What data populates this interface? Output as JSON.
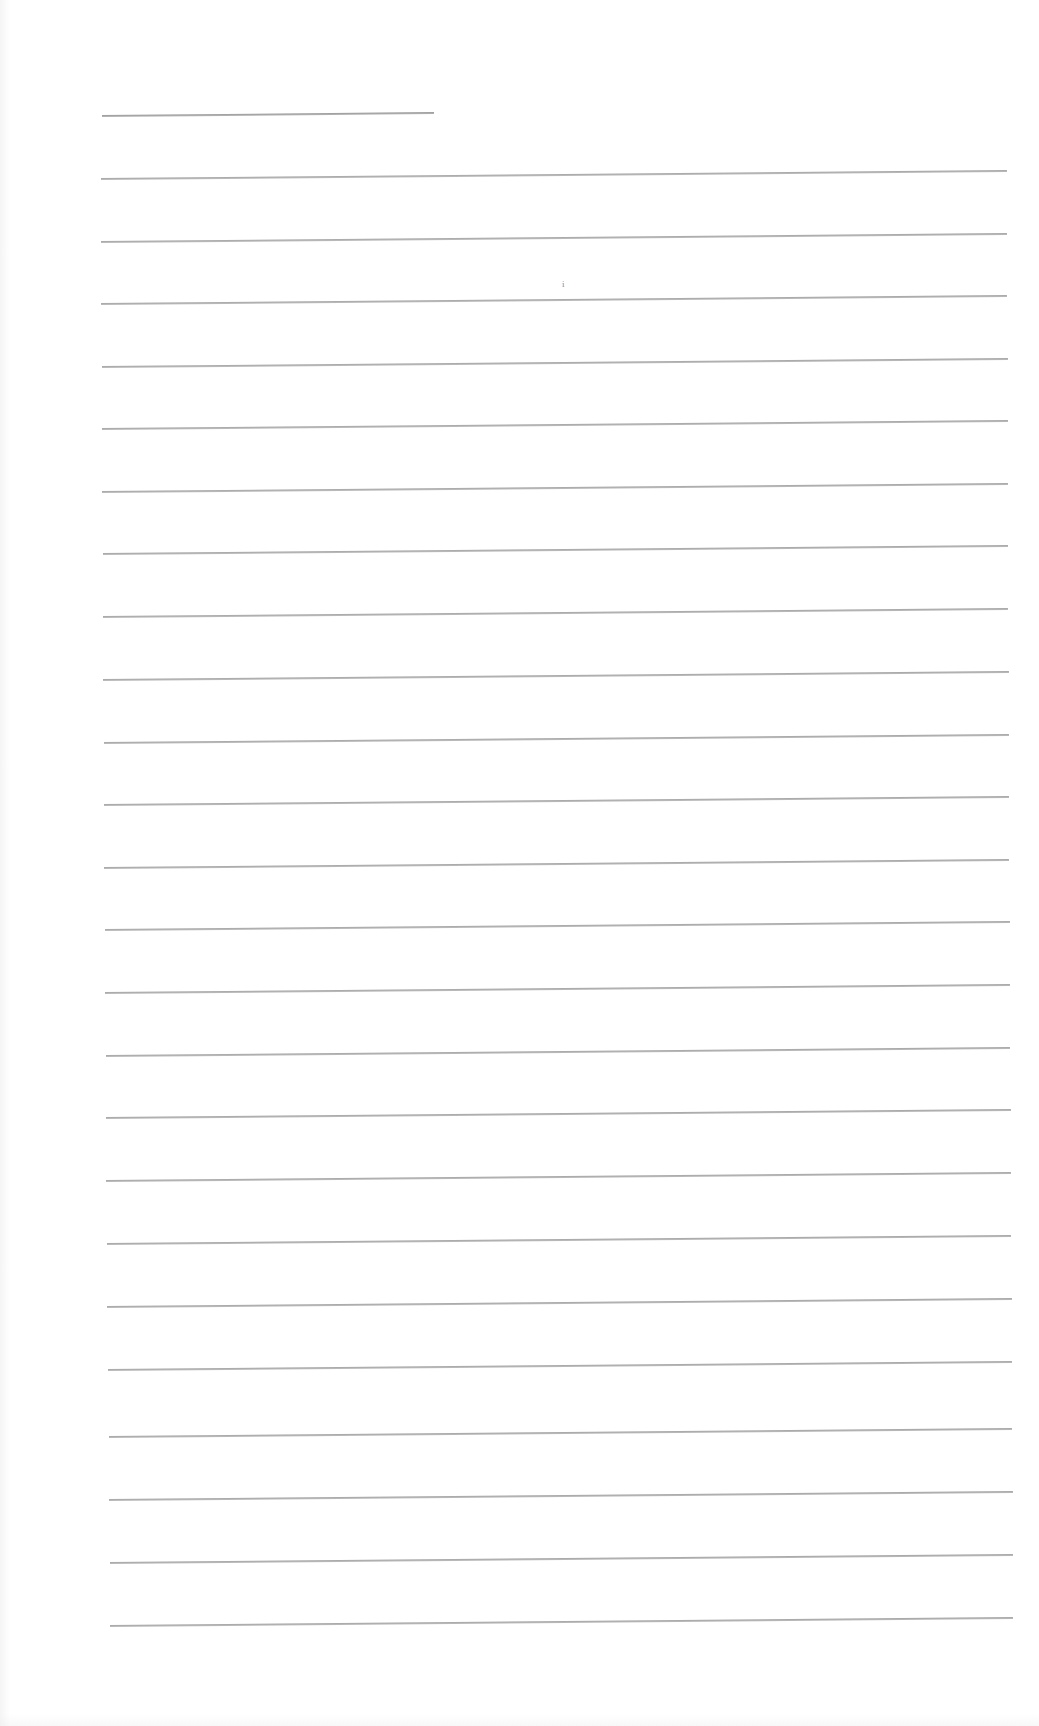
{
  "document": {
    "type": "ruled-writing-sheet",
    "background_color": "#ffffff",
    "rule_color": "#a0a0a0",
    "title_rule": {
      "x1": 102,
      "x2": 434,
      "y": 115
    },
    "rules": [
      {
        "x1": 101,
        "x2": 1007,
        "y": 178
      },
      {
        "x1": 101,
        "x2": 1007,
        "y": 241
      },
      {
        "x1": 101,
        "x2": 1007,
        "y": 303
      },
      {
        "x1": 102,
        "x2": 1008,
        "y": 366
      },
      {
        "x1": 102,
        "x2": 1008,
        "y": 428
      },
      {
        "x1": 102,
        "x2": 1008,
        "y": 491
      },
      {
        "x1": 103,
        "x2": 1008,
        "y": 553
      },
      {
        "x1": 103,
        "x2": 1008,
        "y": 616
      },
      {
        "x1": 103,
        "x2": 1009,
        "y": 679
      },
      {
        "x1": 104,
        "x2": 1009,
        "y": 742
      },
      {
        "x1": 104,
        "x2": 1009,
        "y": 804
      },
      {
        "x1": 104,
        "x2": 1009,
        "y": 867
      },
      {
        "x1": 105,
        "x2": 1010,
        "y": 929
      },
      {
        "x1": 105,
        "x2": 1010,
        "y": 992
      },
      {
        "x1": 106,
        "x2": 1010,
        "y": 1055
      },
      {
        "x1": 106,
        "x2": 1011,
        "y": 1117
      },
      {
        "x1": 106,
        "x2": 1011,
        "y": 1180
      },
      {
        "x1": 107,
        "x2": 1011,
        "y": 1243
      },
      {
        "x1": 107,
        "x2": 1012,
        "y": 1306
      },
      {
        "x1": 108,
        "x2": 1012,
        "y": 1369
      },
      {
        "x1": 109,
        "x2": 1012,
        "y": 1436
      },
      {
        "x1": 109,
        "x2": 1013,
        "y": 1499
      },
      {
        "x1": 110,
        "x2": 1013,
        "y": 1562
      },
      {
        "x1": 110,
        "x2": 1013,
        "y": 1625
      }
    ],
    "marks": [
      {
        "text": "i",
        "x": 562,
        "y": 280
      }
    ],
    "line_tilt_deg": -0.5
  }
}
